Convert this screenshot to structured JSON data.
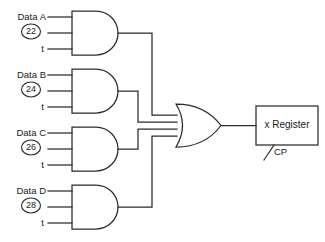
{
  "diagram": {
    "line_color": "#2b2b2b",
    "background": "#ffffff",
    "and_gates": [
      {
        "id": "and-gate-a",
        "data_label": "Data A",
        "control_number": "22",
        "timing_label": "t"
      },
      {
        "id": "and-gate-b",
        "data_label": "Data B",
        "control_number": "24",
        "timing_label": "t"
      },
      {
        "id": "and-gate-c",
        "data_label": "Data C",
        "control_number": "26",
        "timing_label": "t"
      },
      {
        "id": "and-gate-d",
        "data_label": "Data D",
        "control_number": "28",
        "timing_label": "t"
      }
    ],
    "or_gate": {
      "id": "or-gate",
      "input_count": "4"
    },
    "register": {
      "label": "x Register",
      "clock_label": "CP"
    }
  }
}
